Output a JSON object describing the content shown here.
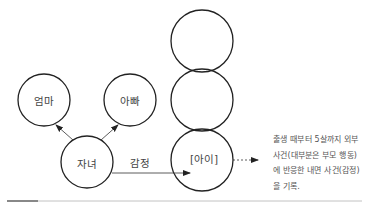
{
  "diagram": {
    "nodes": [
      {
        "id": "mom",
        "label": "엄마",
        "cx": 44,
        "cy": 100,
        "r": 26
      },
      {
        "id": "dad",
        "label": "아빠",
        "cx": 130,
        "cy": 100,
        "r": 26
      },
      {
        "id": "child",
        "label": "자녀",
        "cx": 87,
        "cy": 162,
        "r": 26
      },
      {
        "id": "stack-top",
        "label": "",
        "cx": 202,
        "cy": 41,
        "r": 31
      },
      {
        "id": "stack-middle",
        "label": "",
        "cx": 202,
        "cy": 100,
        "r": 31
      },
      {
        "id": "stack-bottom",
        "label": "[아이]",
        "cx": 202,
        "cy": 160,
        "r": 31
      }
    ],
    "edges": [
      {
        "from": "child",
        "to": "mom",
        "style": "solid"
      },
      {
        "from": "child",
        "to": "dad",
        "style": "solid"
      },
      {
        "from": "child",
        "to": "stack-bottom",
        "label": "감정",
        "style": "solid"
      },
      {
        "from": "stack-bottom",
        "to": "note",
        "style": "dashed"
      }
    ],
    "edge_label_emotion": "감정",
    "note_lines": [
      "출생 때부터 5살까지 외부",
      "사건(대부분은 부모 행동)",
      "에 반응한 내면 사건(감정)",
      "을 기록."
    ]
  }
}
